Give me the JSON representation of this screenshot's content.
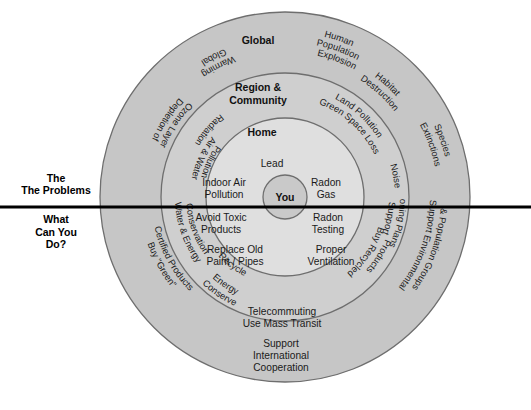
{
  "figure": {
    "center": {
      "label": "You"
    },
    "divider": {
      "upper_caption": "The Problems",
      "lower_caption_line1": "What",
      "lower_caption_line2": "Can You",
      "lower_caption_line3": "Do?"
    },
    "ring_headings": {
      "outer": "Global",
      "middle_line1": "Region &",
      "middle_line2": "Community",
      "inner": "Home"
    },
    "colors": {
      "outer_ring_fill": "#c6c6c6",
      "middle_ring_fill": "#cfcfcf",
      "inner_ring_fill": "#dcdcdc",
      "center_fill": "#c9c9c9",
      "stroke": "#6e6e6e",
      "divider": "#000000",
      "text": "#1a1a1a",
      "background": "#ffffff"
    }
  },
  "problems": {
    "inner_home": [
      {
        "text": "Lead",
        "lines": [
          "Lead"
        ]
      },
      {
        "text": "Indoor Air Pollution",
        "lines": [
          "Indoor Air",
          "Pollution"
        ]
      },
      {
        "text": "Radon Gas",
        "lines": [
          "Radon",
          "Gas"
        ]
      }
    ],
    "middle_region_community": [
      {
        "text": "Radiation",
        "lines": [
          "Radiation"
        ]
      },
      {
        "text": "Air & Water Pollution",
        "lines": [
          "Air & Water",
          "Pollution"
        ]
      },
      {
        "text": "Land Pollution Green Space Loss",
        "lines": [
          "Land Pollution",
          "Green Space Loss"
        ]
      },
      {
        "text": "Noise",
        "lines": [
          "Noise"
        ]
      }
    ],
    "outer_global": [
      {
        "text": "Global Warming",
        "lines": [
          "Global",
          "Warming"
        ]
      },
      {
        "text": "Depletion of Ozone Layer",
        "lines": [
          "Depletion of",
          "Ozone Layer"
        ]
      },
      {
        "text": "Human Population Explosion",
        "lines": [
          "Human",
          "Population",
          "Explosion"
        ]
      },
      {
        "text": "Habitat Destruction",
        "lines": [
          "Habitat",
          "Destruction"
        ]
      },
      {
        "text": "Species Extinctions",
        "lines": [
          "Species",
          "Extinctions"
        ]
      }
    ]
  },
  "solutions": {
    "inner_home": [
      {
        "text": "Avoid Toxic Products",
        "lines": [
          "Avoid Toxic",
          "Products"
        ]
      },
      {
        "text": "Radon Testing",
        "lines": [
          "Radon",
          "Testing"
        ]
      },
      {
        "text": "Replace Old Paint / Pipes",
        "lines": [
          "Replace Old",
          "Paint / Pipes"
        ]
      },
      {
        "text": "Proper Ventilation",
        "lines": [
          "Proper",
          "Ventilation"
        ]
      }
    ],
    "middle_region_community": [
      {
        "text": "Water & Energy Conservation",
        "lines": [
          "Water & Energy",
          "Conservation"
        ]
      },
      {
        "text": "Recycle",
        "lines": [
          "Recycle"
        ]
      },
      {
        "text": "Telecommuting Use Mass Transit",
        "lines": [
          "Telecommuting",
          "Use Mass Transit"
        ]
      },
      {
        "text": "Buy Recycled Products",
        "lines": [
          "Buy Recycled",
          "Products"
        ]
      },
      {
        "text": "Support Zoning Plans",
        "lines": [
          "Support",
          "Zoning Plans"
        ]
      }
    ],
    "outer_global": [
      {
        "text": "Buy \"Green\" Certified Products",
        "lines": [
          "Buy \"Green\"",
          "Certified Products"
        ]
      },
      {
        "text": "Conserve Energy",
        "lines": [
          "Conserve",
          "Energy"
        ]
      },
      {
        "text": "Support International Cooperation",
        "lines": [
          "Support",
          "International",
          "Cooperation"
        ]
      },
      {
        "text": "Support Environmental & Population Groups",
        "lines": [
          "Support Environmental",
          "& Population Groups"
        ]
      }
    ]
  }
}
